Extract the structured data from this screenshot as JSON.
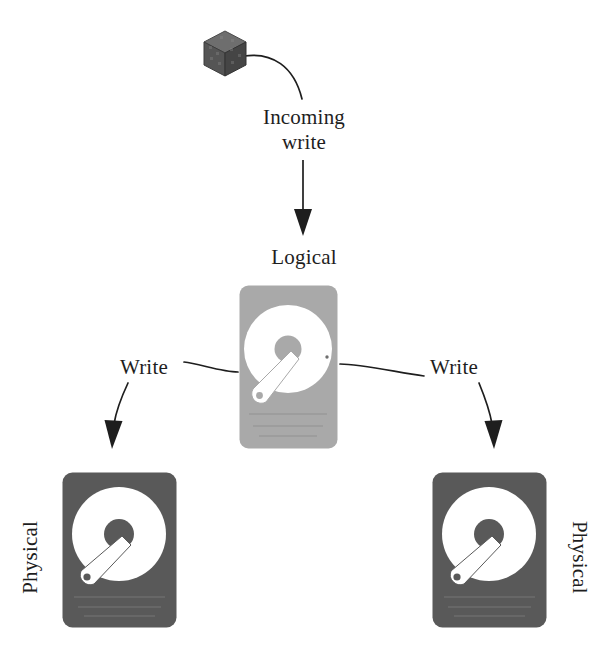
{
  "diagram": {
    "background_color": "#ffffff",
    "text_color": "#1e1e1e",
    "nodes": {
      "incoming_data": {
        "icon": "cube-icon",
        "label_line1": "Incoming",
        "label_line2": "write"
      },
      "logical_disk": {
        "label": "Logical",
        "icon": "hard-disk-icon",
        "body_color": "#a8a8a8",
        "platter_color": "#ffffff",
        "hub_color": "#a8a8a8"
      },
      "physical_disk_left": {
        "label": "Physical",
        "icon": "hard-disk-icon",
        "body_color": "#595959",
        "platter_color": "#ffffff",
        "hub_color": "#595959"
      },
      "physical_disk_right": {
        "label": "Physical",
        "icon": "hard-disk-icon",
        "body_color": "#595959",
        "platter_color": "#ffffff",
        "hub_color": "#595959"
      }
    },
    "edges": {
      "incoming": {
        "label_line1": "Incoming",
        "label_line2": "write",
        "from": "incoming_data",
        "to": "logical_disk",
        "arrow": "filled-triangle"
      },
      "write_left": {
        "label": "Write",
        "from": "logical_disk",
        "to": "physical_disk_left",
        "arrow": "filled-triangle"
      },
      "write_right": {
        "label": "Write",
        "from": "logical_disk",
        "to": "physical_disk_right",
        "arrow": "filled-triangle"
      }
    },
    "line_color": "#1e1e1e"
  }
}
